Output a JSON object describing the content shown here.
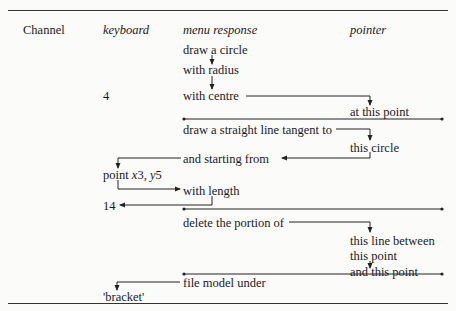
{
  "caption_fragment": "...ne channels",
  "headers": {
    "channel": "Channel",
    "keyboard": "keyboard",
    "menu": "menu response",
    "pointer": "pointer"
  },
  "rows": {
    "m1": "draw a circle",
    "m2": "with radius",
    "k1": "4",
    "m3": "with centre",
    "p1": "at this point",
    "m4": "draw a straight line tangent to",
    "p2": "this circle",
    "m5": "and starting from",
    "k2a": "point ",
    "k2b": "x",
    "k2c": "3, ",
    "k2d": "y",
    "k2e": "5",
    "m6": "with length",
    "k3": "14",
    "m7": "delete the portion of",
    "p3": "this line between",
    "p4": "this point",
    "p5": "and this point",
    "m8": "file model under",
    "k4": "'bracket'"
  }
}
